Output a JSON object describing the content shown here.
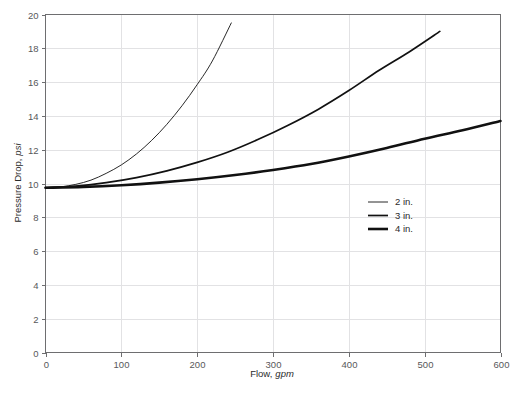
{
  "chart_data": {
    "type": "line",
    "title": "",
    "xlabel": "Flow, gpm",
    "xlabel_text": "Flow,",
    "xlabel_unit": "gpm",
    "ylabel": "Pressure Drop, psi",
    "ylabel_text": "Pressure Drop,",
    "ylabel_unit": "psi",
    "xlim": [
      0,
      600
    ],
    "ylim": [
      0,
      20
    ],
    "xticks": [
      0,
      100,
      200,
      300,
      400,
      500,
      600
    ],
    "yticks": [
      0,
      2,
      4,
      6,
      8,
      10,
      12,
      14,
      16,
      18,
      20
    ],
    "xtick_labels": [
      "0",
      "100",
      "200",
      "300",
      "400",
      "500",
      "600"
    ],
    "ytick_labels": [
      "0",
      "2",
      "4",
      "6",
      "8",
      "10",
      "12",
      "14",
      "16",
      "18",
      "20"
    ],
    "grid": true,
    "grid_color": "#e2e2e4",
    "legend_position": "center-right",
    "series": [
      {
        "name": "2 in.",
        "label": "2 in.",
        "stroke_width": 0.9,
        "color": "#111111",
        "x": [
          0,
          20,
          40,
          60,
          80,
          100,
          120,
          140,
          160,
          180,
          200,
          220,
          245
        ],
        "y": [
          9.75,
          9.8,
          9.95,
          10.2,
          10.6,
          11.1,
          11.75,
          12.55,
          13.5,
          14.6,
          15.85,
          17.25,
          19.5
        ]
      },
      {
        "name": "3 in.",
        "label": "3 in.",
        "stroke_width": 1.7,
        "color": "#111111",
        "x": [
          0,
          40,
          80,
          120,
          160,
          200,
          240,
          280,
          320,
          360,
          400,
          440,
          480,
          520
        ],
        "y": [
          9.75,
          9.85,
          10.05,
          10.35,
          10.75,
          11.25,
          11.85,
          12.6,
          13.45,
          14.4,
          15.5,
          16.7,
          17.8,
          19.0
        ]
      },
      {
        "name": "4 in.",
        "label": "4 in.",
        "stroke_width": 2.6,
        "color": "#111111",
        "x": [
          0,
          50,
          100,
          150,
          200,
          250,
          300,
          350,
          400,
          450,
          500,
          550,
          600
        ],
        "y": [
          9.75,
          9.8,
          9.9,
          10.05,
          10.25,
          10.5,
          10.8,
          11.15,
          11.6,
          12.1,
          12.65,
          13.15,
          13.7
        ]
      }
    ]
  },
  "legend": {
    "entries": [
      {
        "label": "2 in."
      },
      {
        "label": "3 in."
      },
      {
        "label": "4 in."
      }
    ]
  },
  "colors": {
    "background": "#ffffff",
    "axis": "#6e6e70",
    "grid": "#e2e2e4",
    "series": "#111111",
    "tick_text": "#58585a",
    "title_text": "#2b2b2b"
  }
}
